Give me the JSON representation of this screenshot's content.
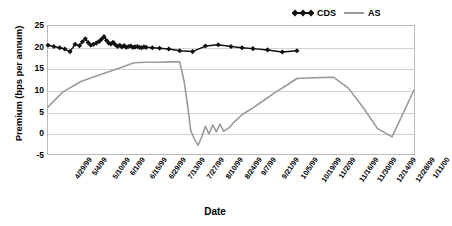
{
  "chart_data": {
    "type": "line",
    "title": "",
    "xlabel": "Date",
    "ylabel": "Premium (bps per annum)",
    "ylim": [
      -5,
      25
    ],
    "yticks": [
      25,
      20,
      15,
      10,
      5,
      0,
      -5
    ],
    "grid": true,
    "legend_position": "top-right",
    "categories": [
      "4/29/99",
      "5/4/99",
      "5/10/99",
      "6/1/99",
      "6/15/99",
      "6/29/99",
      "7/13/99",
      "7/27/99",
      "8/10/99",
      "8/24/99",
      "9/7/99",
      "9/21/99",
      "10/5/99",
      "10/19/99",
      "11/2/99",
      "11/16/99",
      "11/30/99",
      "12/14/99",
      "12/28/99",
      "1/11/00"
    ],
    "series": [
      {
        "name": "CDS",
        "color": "#111111",
        "marker": "diamond",
        "x": [
          0,
          1.6,
          3.2,
          4.6,
          6.0,
          7.4,
          8.6,
          9.4,
          10.2,
          11.0,
          11.7,
          12.4,
          13.2,
          14.0,
          14.6,
          15.3,
          16.0,
          16.6,
          17.2,
          17.8,
          18.4,
          19.0,
          19.6,
          20.2,
          20.8,
          21.4,
          22.0,
          22.6,
          23.2,
          23.8,
          24.4,
          25.0,
          25.6,
          26.2,
          26.8,
          28.5,
          30.5,
          33.0,
          36.0,
          39.5,
          43.0,
          46.5,
          50.0,
          53.0,
          56.0,
          60.0,
          64.0,
          68.0
        ],
        "values": [
          20.5,
          20.2,
          19.9,
          19.6,
          19.0,
          20.7,
          20.4,
          21.3,
          22.0,
          21.1,
          20.5,
          20.7,
          21.0,
          21.4,
          21.9,
          22.5,
          21.6,
          21.0,
          20.8,
          21.2,
          20.6,
          20.2,
          20.5,
          20.1,
          20.4,
          20.0,
          20.2,
          20.3,
          20.0,
          20.1,
          20.2,
          20.0,
          19.9,
          20.1,
          20.0,
          19.9,
          19.8,
          19.6,
          19.2,
          19.0,
          20.3,
          20.6,
          20.2,
          19.9,
          19.7,
          19.4,
          18.9,
          19.2
        ]
      },
      {
        "name": "AS",
        "color": "#9a9a9a",
        "marker": "none",
        "x": [
          0,
          4.0,
          9.0,
          14.0,
          19.0,
          23.5,
          27.0,
          30.0,
          33.5,
          36.0,
          37.2,
          38.2,
          39.0,
          40.0,
          41.0,
          42.0,
          43.0,
          44.0,
          45.0,
          46.0,
          47.0,
          48.0,
          49.5,
          51.0,
          53.0,
          56.0,
          59.0,
          62.0,
          65.0,
          68.0,
          71.0,
          74.0,
          78.0,
          82.0,
          86.0,
          90.0,
          94.0,
          100.0
        ],
        "values": [
          6.0,
          9.5,
          12.0,
          13.5,
          15.0,
          16.4,
          16.5,
          16.5,
          16.6,
          16.6,
          12.0,
          6.0,
          0.5,
          -1.5,
          -3.0,
          -1.0,
          1.5,
          -0.3,
          1.8,
          0.2,
          2.0,
          0.3,
          1.2,
          2.6,
          4.2,
          5.8,
          7.6,
          9.4,
          11.0,
          12.7,
          12.8,
          12.9,
          13.0,
          10.5,
          6.0,
          1.0,
          -1.0,
          10.0
        ]
      }
    ]
  },
  "legend": {
    "entries": [
      {
        "label": "CDS",
        "icon": "diamond-line-marker"
      },
      {
        "label": "AS",
        "icon": "gray-line-marker"
      }
    ]
  },
  "axes": {
    "x_title": "Date",
    "y_title": "Premium (bps per annum)"
  }
}
